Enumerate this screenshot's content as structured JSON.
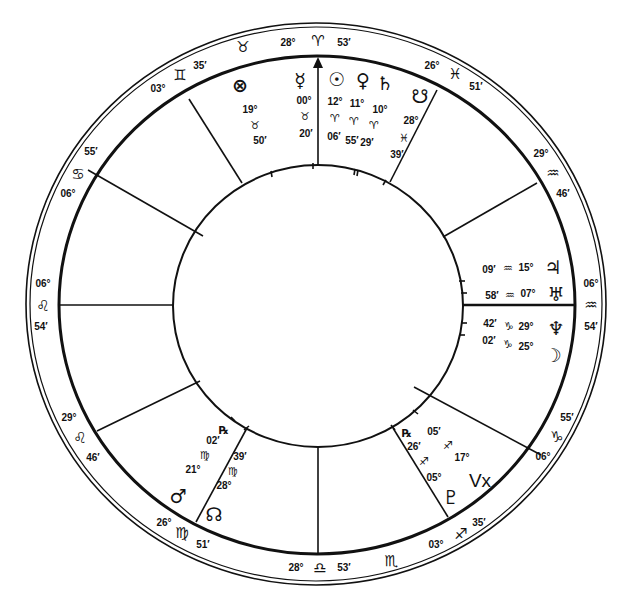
{
  "chart": {
    "type": "natal-wheel",
    "house_cusps": [
      {
        "name": "MC",
        "deg": "28°",
        "sign_glyph": "♈",
        "sign": "aries",
        "min": "53′"
      },
      {
        "name": "cusp-11",
        "deg": "26°",
        "sign_glyph": "♓",
        "sign": "pisces",
        "min": "51′"
      },
      {
        "name": "cusp-12",
        "deg": "29°",
        "sign_glyph": "♒",
        "sign": "aquarius",
        "min": "46′"
      },
      {
        "name": "ASC",
        "deg": "06°",
        "sign_glyph": "♒",
        "sign": "aquarius",
        "min": "54′"
      },
      {
        "name": "cusp-2",
        "deg": "06°",
        "sign_glyph": "♑",
        "sign": "capricorn",
        "min": "55′"
      },
      {
        "name": "cusp-3",
        "deg": "03°",
        "sign_glyph": "♐",
        "sign": "sagittarius",
        "min": "35′"
      },
      {
        "name": "IC",
        "deg": "28°",
        "sign_glyph": "♎",
        "sign": "libra",
        "min": "53′"
      },
      {
        "name": "cusp-5",
        "deg": "26°",
        "sign_glyph": "♍",
        "sign": "virgo",
        "min": "51′"
      },
      {
        "name": "cusp-6",
        "deg": "29°",
        "sign_glyph": "♌",
        "sign": "leo",
        "min": "46′"
      },
      {
        "name": "DESC",
        "deg": "06°",
        "sign_glyph": "♌",
        "sign": "leo",
        "min": "54′"
      },
      {
        "name": "cusp-8",
        "deg": "06°",
        "sign_glyph": "♋",
        "sign": "cancer",
        "min": "55′"
      },
      {
        "name": "cusp-9",
        "deg": "03°",
        "sign_glyph": "♊",
        "sign": "gemini",
        "min": "35′"
      }
    ],
    "intercepted_signs": [
      {
        "sign": "taurus",
        "glyph": "♉"
      },
      {
        "sign": "scorpio",
        "glyph": "♏"
      }
    ],
    "planets": [
      {
        "name": "Part of Fortune",
        "glyph": "⊗",
        "deg": "19°",
        "sign_glyph": "♉",
        "min": "50′"
      },
      {
        "name": "Mercury",
        "glyph": "☿",
        "deg": "00°",
        "sign_glyph": "♉",
        "min": "20′"
      },
      {
        "name": "Sun",
        "glyph": "☉",
        "deg": "12°",
        "sign_glyph": "♈",
        "min": "06′"
      },
      {
        "name": "Venus",
        "glyph": "♀",
        "deg": "11°",
        "sign_glyph": "♈",
        "min": "55′"
      },
      {
        "name": "Saturn",
        "glyph": "♄",
        "deg": "10°",
        "sign_glyph": "♈",
        "min": "29′"
      },
      {
        "name": "South Node",
        "glyph": "☋",
        "deg": "28°",
        "sign_glyph": "♓",
        "min": "39′"
      },
      {
        "name": "Jupiter",
        "glyph": "♃",
        "deg": "15°",
        "sign_glyph": "♒",
        "min": "09′"
      },
      {
        "name": "Uranus",
        "glyph": "♅",
        "deg": "07°",
        "sign_glyph": "♒",
        "min": "58′"
      },
      {
        "name": "Neptune",
        "glyph": "♆",
        "deg": "29°",
        "sign_glyph": "♑",
        "min": "42′"
      },
      {
        "name": "Moon",
        "glyph": "☽",
        "deg": "25°",
        "sign_glyph": "♑",
        "min": "02′"
      },
      {
        "name": "Vertex",
        "glyph": "Vx",
        "deg": "17°",
        "sign_glyph": "♐",
        "min": "05′"
      },
      {
        "name": "Pluto",
        "glyph": "♇",
        "deg": "05°",
        "sign_glyph": "♐",
        "min": "26′",
        "retrograde": "℞"
      },
      {
        "name": "Mars",
        "glyph": "♂",
        "deg": "21°",
        "sign_glyph": "♍",
        "min": "02′",
        "retrograde": "℞"
      },
      {
        "name": "North Node",
        "glyph": "☊",
        "deg": "28°",
        "sign_glyph": "♍",
        "min": "39′"
      }
    ]
  }
}
